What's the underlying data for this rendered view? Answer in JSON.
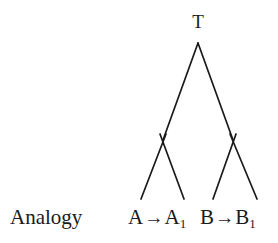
{
  "figure": {
    "caption_label": "Analogy",
    "background_color": "#ffffff",
    "stroke_color": "#1a1a1a"
  },
  "tree": {
    "root": {
      "label": "T",
      "x": 198,
      "y": 43
    },
    "internal_nodes": [
      {
        "name": "left-internal-node",
        "x": 163,
        "y": 140
      },
      {
        "name": "right-internal-node",
        "x": 233,
        "y": 140
      }
    ],
    "leaves": [
      {
        "name": "leaf-tip-1",
        "x": 141,
        "y": 199
      },
      {
        "name": "leaf-tip-2",
        "x": 184,
        "y": 199
      },
      {
        "name": "leaf-tip-3",
        "x": 213,
        "y": 199
      },
      {
        "name": "leaf-tip-4",
        "x": 257,
        "y": 199
      }
    ],
    "edges": [
      {
        "name": "edge-root-to-left",
        "x1": 198,
        "y1": 43,
        "x2": 163,
        "y2": 140
      },
      {
        "name": "edge-root-to-right",
        "x1": 198,
        "y1": 43,
        "x2": 233,
        "y2": 140
      },
      {
        "name": "edge-left-to-leaf1",
        "x1": 163,
        "y1": 140,
        "x2": 141,
        "y2": 199
      },
      {
        "name": "edge-left-to-leaf2",
        "x1": 163,
        "y1": 140,
        "x2": 184,
        "y2": 199
      },
      {
        "name": "edge-right-to-leaf3",
        "x1": 233,
        "y1": 140,
        "x2": 213,
        "y2": 199
      },
      {
        "name": "edge-right-to-leaf4",
        "x1": 233,
        "y1": 140,
        "x2": 257,
        "y2": 199
      }
    ]
  },
  "labels": {
    "left_pair": {
      "source": "A",
      "arrow": "→",
      "target_base": "A",
      "target_subscript": "1"
    },
    "right_pair": {
      "source": "B",
      "arrow": "→",
      "target_base": "B",
      "target_subscript": "1"
    }
  }
}
